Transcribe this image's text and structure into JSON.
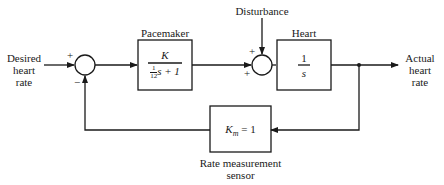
{
  "diagram": {
    "type": "block-diagram",
    "input": {
      "label_lines": [
        "Desired",
        "heart",
        "rate"
      ]
    },
    "output": {
      "label_lines": [
        "Actual",
        "heart",
        "rate"
      ]
    },
    "disturbance": {
      "label": "Disturbance"
    },
    "summing_junction_1": {
      "top_sign": "+",
      "bottom_sign": "−"
    },
    "summing_junction_2": {
      "top_sign": "+",
      "left_sign": "+"
    },
    "pacemaker": {
      "title": "Pacemaker",
      "numerator": "K",
      "denominator_frac_num": "1",
      "denominator_frac_den": "12",
      "denominator_rest": "s + 1"
    },
    "heart": {
      "title": "Heart",
      "numerator": "1",
      "denominator": "s"
    },
    "sensor": {
      "gain_symbol": "K",
      "gain_subscript": "m",
      "gain_value": " = 1",
      "label_lines": [
        "Rate measurement",
        "sensor"
      ]
    },
    "colors": {
      "line": "#1a1a1a",
      "background": "#ffffff"
    }
  }
}
